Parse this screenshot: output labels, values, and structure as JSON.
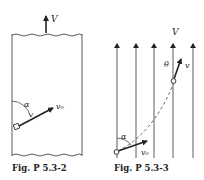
{
  "figures": [
    {
      "id": "fig-p-5-3-2",
      "caption": "Fig. P 5.3-2",
      "labels": {
        "stream_velocity": "V",
        "initial_velocity": "v₀",
        "angle": "α"
      }
    },
    {
      "id": "fig-p-5-3-3",
      "caption": "Fig. P 5.3-3",
      "labels": {
        "stream_velocity": "V",
        "velocity": "v",
        "angle_theta": "θ",
        "initial_velocity": "v₀",
        "angle_alpha": "α"
      }
    }
  ],
  "colors": {
    "ink": "#222222",
    "background": "#ffffff"
  }
}
